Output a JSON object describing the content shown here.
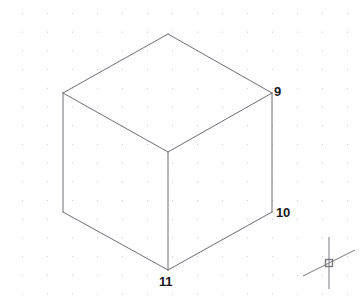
{
  "app": {
    "title": "CAD Isometric View",
    "background_color": "#ffffff"
  },
  "viewport": {
    "width": 361,
    "height": 307,
    "grid": {
      "visible": true,
      "dot_color": "#c8c8d2",
      "spacing_x": 25,
      "spacing_y": 18.7,
      "origin_x": 22,
      "origin_y": 13
    }
  },
  "drawing": {
    "name": "isometric-cube",
    "line_color": "#6e6e76",
    "line_width": 1,
    "edges": [
      {
        "name": "top-left-edge",
        "x1": 63,
        "y1": 93,
        "x2": 168,
        "y2": 34
      },
      {
        "name": "top-right-edge",
        "x1": 168,
        "y1": 34,
        "x2": 272,
        "y2": 93
      },
      {
        "name": "top-face-left-diagonal",
        "x1": 63,
        "y1": 93,
        "x2": 168,
        "y2": 152
      },
      {
        "name": "top-face-right-diagonal",
        "x1": 168,
        "y1": 152,
        "x2": 272,
        "y2": 93
      },
      {
        "name": "left-vertical-edge",
        "x1": 63,
        "y1": 93,
        "x2": 63,
        "y2": 212
      },
      {
        "name": "center-vertical-edge",
        "x1": 168,
        "y1": 152,
        "x2": 168,
        "y2": 270
      },
      {
        "name": "right-vertical-edge",
        "x1": 272,
        "y1": 93,
        "x2": 272,
        "y2": 212
      },
      {
        "name": "bottom-left-edge",
        "x1": 63,
        "y1": 212,
        "x2": 168,
        "y2": 270
      },
      {
        "name": "bottom-right-edge",
        "x1": 168,
        "y1": 270,
        "x2": 272,
        "y2": 212
      }
    ],
    "vertices": [
      {
        "name": "vertex-top",
        "x": 168,
        "y": 34
      },
      {
        "name": "vertex-left-upper",
        "x": 63,
        "y": 93
      },
      {
        "name": "vertex-right-upper",
        "x": 272,
        "y": 93,
        "label": "9"
      },
      {
        "name": "vertex-center-front",
        "x": 168,
        "y": 152
      },
      {
        "name": "vertex-left-lower",
        "x": 63,
        "y": 212
      },
      {
        "name": "vertex-right-lower",
        "x": 272,
        "y": 212,
        "label": "10"
      },
      {
        "name": "vertex-bottom-front",
        "x": 168,
        "y": 270,
        "label": "11"
      }
    ]
  },
  "labels": {
    "vertex_9": "9",
    "vertex_10": "10",
    "vertex_11": "11",
    "color": "#1a1a1a"
  },
  "cursor": {
    "name": "crosshair-cursor",
    "color": "#7a7a82",
    "center_x": 329,
    "center_y": 263,
    "pickbox_size": 7,
    "vertical_extent": 26,
    "diagonal_extent": 26
  }
}
